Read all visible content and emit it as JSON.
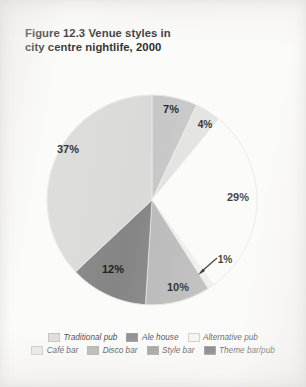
{
  "figure": {
    "title_line1": "Figure 12.3  Venue styles in",
    "title_line2": "city centre nightlife, 2000"
  },
  "legend": {
    "row1": [
      {
        "label": "Traditional pub",
        "color": "#dcdcdc",
        "swatch_name": "legend-swatch-traditional-pub"
      },
      {
        "label": "Ale house",
        "color": "#8e8e8e",
        "swatch_name": "legend-swatch-ale-house"
      },
      {
        "label": "Alternative pub",
        "color": "#f4f4f2",
        "swatch_name": "legend-swatch-alternative-pub"
      }
    ],
    "row2": [
      {
        "label": "Café bar",
        "color": "#e8e8e6",
        "swatch_name": "legend-swatch-cafe-bar"
      },
      {
        "label": "Disco bar",
        "color": "#b4b4b4",
        "swatch_name": "legend-swatch-disco-bar"
      },
      {
        "label": "Style bar",
        "color": "#9a9a9a",
        "swatch_name": "legend-swatch-style-bar"
      },
      {
        "label": "Theme bar/pub",
        "color": "#6e6e6e",
        "swatch_name": "legend-swatch-theme-bar-pub"
      }
    ]
  },
  "chart_data": {
    "type": "pie",
    "title": "Figure 12.3  Venue styles in city centre nightlife, 2000",
    "xlabel": "",
    "ylabel": "",
    "units": "percent",
    "total": 100,
    "legend_position": "bottom",
    "grid": false,
    "start_angle_deg": 0,
    "direction": "clockwise",
    "categories": [
      "Theme bar/pub",
      "Style bar",
      "Alternative pub",
      "Café bar",
      "Disco bar",
      "Ale house",
      "Traditional pub"
    ],
    "values": [
      7,
      4,
      29,
      1,
      10,
      12,
      37
    ],
    "labels": [
      "7%",
      "4%",
      "29%",
      "1%",
      "10%",
      "12%",
      "37%"
    ],
    "colors": [
      "#c6c6c6",
      "#e2e2e0",
      "#fbfbf9",
      "#eeeeec",
      "#b9b9b9",
      "#858585",
      "#dadad8"
    ],
    "slices": [
      {
        "name": "Theme bar/pub",
        "value": 7,
        "label": "7%",
        "color": "#c6c6c6",
        "label_x": 171,
        "label_y": 110
      },
      {
        "name": "Style bar",
        "value": 4,
        "label": "4%",
        "color": "#e2e2e0",
        "label_x": 205,
        "label_y": 125
      },
      {
        "name": "Alternative pub",
        "value": 29,
        "label": "29%",
        "color": "#fbfbf9",
        "label_x": 238,
        "label_y": 198
      },
      {
        "name": "Café bar",
        "value": 1,
        "label": "1%",
        "color": "#eeeeec",
        "label_x": 225,
        "label_y": 260
      },
      {
        "name": "Disco bar",
        "value": 10,
        "label": "10%",
        "color": "#b9b9b9",
        "label_x": 178,
        "label_y": 288
      },
      {
        "name": "Ale house",
        "value": 12,
        "label": "12%",
        "color": "#858585",
        "label_x": 113,
        "label_y": 270
      },
      {
        "name": "Traditional pub",
        "value": 37,
        "label": "37%",
        "color": "#dadad8",
        "label_x": 68,
        "label_y": 150
      }
    ],
    "annotations": [
      {
        "name": "callout-arrow-cafe-bar",
        "text": "1%",
        "points_to": "Café bar"
      }
    ]
  }
}
